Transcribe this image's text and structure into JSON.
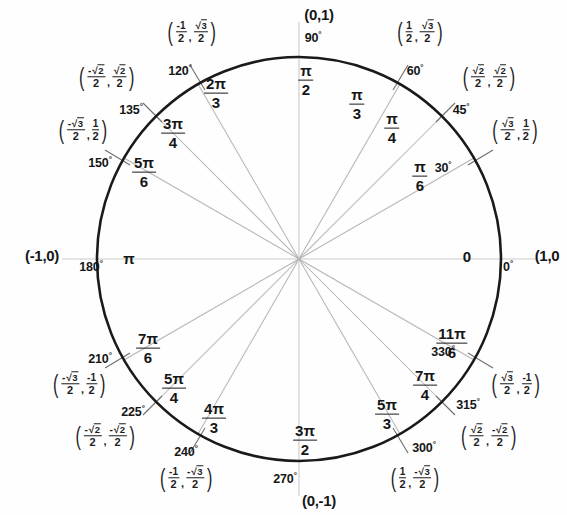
{
  "figure": {
    "name": "unit-circle",
    "center": {
      "x": 299,
      "y": 259
    },
    "radius": 202,
    "circle_color": "#1a1a1a",
    "spoke_color": "#b9b9b9",
    "axis_color": "#c9c9c9",
    "text_color": "#161616"
  },
  "axis_points": {
    "top": "(0,1)",
    "bottom": "(0,-1)",
    "left": "(-1,0)",
    "right": "(1,0"
  },
  "axis_angles": {
    "right_deg": "0",
    "right_rad": "0",
    "top_deg": "90",
    "bottom_deg": "270",
    "left_deg": "180",
    "left_rad": "π"
  },
  "axis_radians": {
    "top_num": "π",
    "top_den": "2",
    "bottom_num": "3π",
    "bottom_den": "2"
  },
  "degrees": {
    "d30": "30",
    "d45": "45",
    "d60": "60",
    "d120": "120",
    "d135": "135",
    "d150": "150",
    "d210": "210",
    "d225": "225",
    "d240": "240",
    "d300": "300",
    "d315": "315",
    "d330": "330",
    "suffix": "°"
  },
  "radians": [
    {
      "key": "r30",
      "num": "π",
      "den": "6"
    },
    {
      "key": "r45",
      "num": "π",
      "den": "4"
    },
    {
      "key": "r60",
      "num": "π",
      "den": "3"
    },
    {
      "key": "r120",
      "num": "2π",
      "den": "3"
    },
    {
      "key": "r135",
      "num": "3π",
      "den": "4"
    },
    {
      "key": "r150",
      "num": "5π",
      "den": "6"
    },
    {
      "key": "r210",
      "num": "7π",
      "den": "6"
    },
    {
      "key": "r225",
      "num": "5π",
      "den": "4"
    },
    {
      "key": "r240",
      "num": "4π",
      "den": "3"
    },
    {
      "key": "r300",
      "num": "5π",
      "den": "3"
    },
    {
      "key": "r315",
      "num": "7π",
      "den": "4"
    },
    {
      "key": "r330",
      "num": "11π",
      "den": "6"
    }
  ],
  "coordinates": {
    "c30": {
      "x_num": "√3",
      "x_den": "2",
      "x_neg": false,
      "y_num": "1",
      "y_den": "2",
      "y_neg": false
    },
    "c45": {
      "x_num": "√2",
      "x_den": "2",
      "x_neg": false,
      "y_num": "√2",
      "y_den": "2",
      "y_neg": false
    },
    "c60": {
      "x_num": "1",
      "x_den": "2",
      "x_neg": false,
      "y_num": "√3",
      "y_den": "2",
      "y_neg": false
    },
    "c120": {
      "x_num": "1",
      "x_den": "2",
      "x_neg": true,
      "y_num": "√3",
      "y_den": "2",
      "y_neg": false
    },
    "c135": {
      "x_num": "√2",
      "x_den": "2",
      "x_neg": true,
      "y_num": "√2",
      "y_den": "2",
      "y_neg": false
    },
    "c150": {
      "x_num": "√3",
      "x_den": "2",
      "x_neg": true,
      "y_num": "1",
      "y_den": "2",
      "y_neg": false
    },
    "c210": {
      "x_num": "√3",
      "x_den": "2",
      "x_neg": true,
      "y_num": "1",
      "y_den": "2",
      "y_neg": true
    },
    "c225": {
      "x_num": "√2",
      "x_den": "2",
      "x_neg": true,
      "y_num": "√2",
      "y_den": "2",
      "y_neg": true
    },
    "c240": {
      "x_num": "1",
      "x_den": "2",
      "x_neg": true,
      "y_num": "√3",
      "y_den": "2",
      "y_neg": true
    },
    "c300": {
      "x_num": "1",
      "x_den": "2",
      "x_neg": false,
      "y_num": "√3",
      "y_den": "2",
      "y_neg": true
    },
    "c315": {
      "x_num": "√2",
      "x_den": "2",
      "x_neg": false,
      "y_num": "√2",
      "y_den": "2",
      "y_neg": true
    },
    "c330": {
      "x_num": "√3",
      "x_den": "2",
      "x_neg": false,
      "y_num": "1",
      "y_den": "2",
      "y_neg": true
    }
  },
  "chart_data": {
    "type": "scatter",
    "xlabel": "",
    "ylabel": "",
    "xlim": [
      -1,
      1
    ],
    "ylim": [
      -1,
      1
    ],
    "grid": false,
    "legend": "none",
    "points": [
      {
        "degrees": 0,
        "radians": "0",
        "x": 1,
        "y": 0,
        "label_x": "1",
        "label_y": "0"
      },
      {
        "degrees": 30,
        "radians": "π/6",
        "x": 0.866,
        "y": 0.5,
        "label_x": "√3/2",
        "label_y": "1/2"
      },
      {
        "degrees": 45,
        "radians": "π/4",
        "x": 0.7071,
        "y": 0.7071,
        "label_x": "√2/2",
        "label_y": "√2/2"
      },
      {
        "degrees": 60,
        "radians": "π/3",
        "x": 0.5,
        "y": 0.866,
        "label_x": "1/2",
        "label_y": "√3/2"
      },
      {
        "degrees": 90,
        "radians": "π/2",
        "x": 0,
        "y": 1,
        "label_x": "0",
        "label_y": "1"
      },
      {
        "degrees": 120,
        "radians": "2π/3",
        "x": -0.5,
        "y": 0.866,
        "label_x": "-1/2",
        "label_y": "√3/2"
      },
      {
        "degrees": 135,
        "radians": "3π/4",
        "x": -0.7071,
        "y": 0.7071,
        "label_x": "-√2/2",
        "label_y": "√2/2"
      },
      {
        "degrees": 150,
        "radians": "5π/6",
        "x": -0.866,
        "y": 0.5,
        "label_x": "-√3/2",
        "label_y": "1/2"
      },
      {
        "degrees": 180,
        "radians": "π",
        "x": -1,
        "y": 0,
        "label_x": "-1",
        "label_y": "0"
      },
      {
        "degrees": 210,
        "radians": "7π/6",
        "x": -0.866,
        "y": -0.5,
        "label_x": "-√3/2",
        "label_y": "-1/2"
      },
      {
        "degrees": 225,
        "radians": "5π/4",
        "x": -0.7071,
        "y": -0.7071,
        "label_x": "-√2/2",
        "label_y": "-√2/2"
      },
      {
        "degrees": 240,
        "radians": "4π/3",
        "x": -0.5,
        "y": -0.866,
        "label_x": "-1/2",
        "label_y": "-√3/2"
      },
      {
        "degrees": 270,
        "radians": "3π/2",
        "x": 0,
        "y": -1,
        "label_x": "0",
        "label_y": "-1"
      },
      {
        "degrees": 300,
        "radians": "5π/3",
        "x": 0.5,
        "y": -0.866,
        "label_x": "1/2",
        "label_y": "-√3/2"
      },
      {
        "degrees": 315,
        "radians": "7π/4",
        "x": 0.7071,
        "y": -0.7071,
        "label_x": "√2/2",
        "label_y": "-√2/2"
      },
      {
        "degrees": 330,
        "radians": "11π/6",
        "x": 0.866,
        "y": -0.5,
        "label_x": "√3/2",
        "label_y": "-1/2"
      }
    ]
  }
}
